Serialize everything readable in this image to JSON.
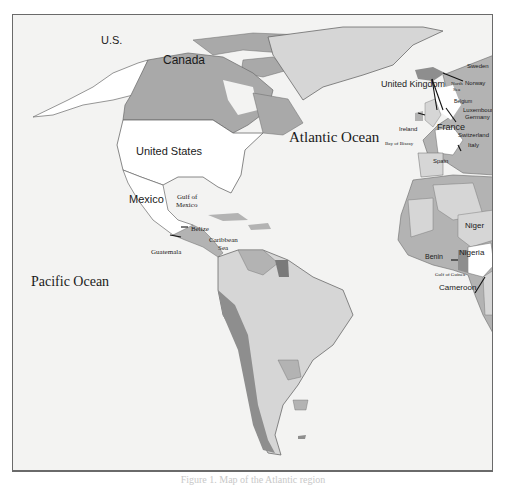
{
  "map": {
    "colors": {
      "ocean": "#f3f3f2",
      "canada": "#a9a9a9",
      "us": "#ffffff",
      "light_land": "#d6d6d6",
      "mid_land": "#b3b3b3",
      "dark_land": "#8e8e8e",
      "border": "#6a6a6a"
    },
    "oceans": {
      "atlantic": "Atlantic Ocean",
      "pacific": "Pacific Ocean"
    },
    "seas": {
      "gulf_of_mexico_1": "Gulf of",
      "gulf_of_mexico_2": "Mexico",
      "caribbean_1": "Caribbean",
      "caribbean_2": "Sea",
      "north_sea_1": "North",
      "north_sea_2": "Sea",
      "bay_of_biscay": "Bay of Biscay",
      "gulf_of_guinea": "Gulf of Guinea"
    },
    "countries": {
      "us_alaska": "U.S.",
      "canada": "Canada",
      "united_states": "United States",
      "mexico": "Mexico",
      "belize": "Belize",
      "guatemala": "Guatemala",
      "united_kingdom": "United Kingdom",
      "ireland": "Ireland",
      "sweden": "Sweden",
      "norway": "Norway",
      "belgium": "Belgium",
      "luxembourg": "Luxembourg",
      "germany": "Germany",
      "france": "France",
      "switzerland": "Switzerland",
      "italy": "Italy",
      "spain": "Spain",
      "niger": "Niger",
      "nigeria": "Nigeria",
      "benin": "Benin",
      "cameroon": "Cameroon"
    }
  },
  "caption": "Figure 1. Map of the Atlantic region"
}
